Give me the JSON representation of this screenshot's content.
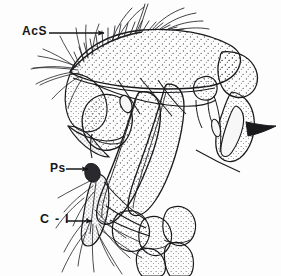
{
  "figure": {
    "type": "scientific-line-drawing",
    "background_color": "#fdfdfd",
    "ink_color": "#1a1a1c",
    "stipple_color": "#3a3a3e"
  },
  "labels": [
    {
      "id": "acs",
      "text": "AcS",
      "leader": "arrow-right",
      "points_to": "anterior row of short setae on dorsal margin"
    },
    {
      "id": "ps",
      "text": "Ps",
      "leader": "arrow-right",
      "points_to": "small ventral process"
    },
    {
      "id": "c1",
      "text": "C - I",
      "leader": "arrow-right-angled",
      "points_to": "coxa of first leg"
    }
  ]
}
